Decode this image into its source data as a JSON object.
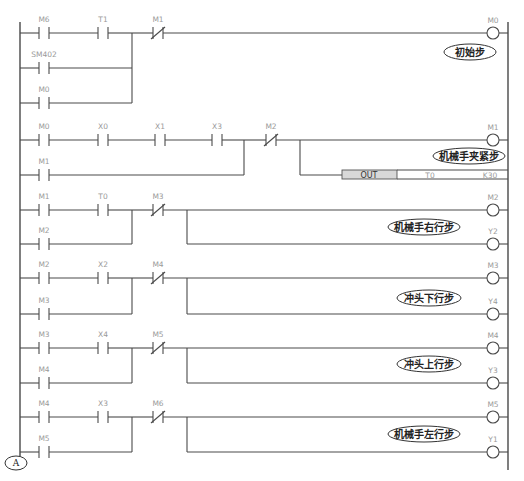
{
  "diagram": {
    "left_rail_x": 20,
    "right_rail_x": 508,
    "rail_top": 22,
    "rail_bottom": 470,
    "coil_x": 493,
    "colors": {
      "wire": "#4a4a4a",
      "label": "#9a9a9a",
      "note_text": "#222222",
      "out_box": "#d8d8d8"
    }
  },
  "rungs": [
    {
      "id": "rung-1",
      "main_y": 33,
      "series": [
        {
          "name": "M6",
          "type": "NO",
          "x": 44
        },
        {
          "name": "T1",
          "type": "NO",
          "x": 103
        }
      ],
      "parallel": [
        {
          "name": "SM402",
          "type": "NO",
          "x": 44,
          "y": 68
        },
        {
          "name": "M0",
          "type": "NO",
          "x": 44,
          "y": 103
        }
      ],
      "junction_x": 132,
      "interlock": {
        "name": "M1",
        "type": "NC",
        "x": 158
      },
      "outputs": [
        {
          "kind": "coil",
          "name": "M0",
          "y": 33
        }
      ],
      "note": {
        "text": "初始步",
        "cx": 470,
        "cy": 52,
        "rx": 26
      }
    },
    {
      "id": "rung-2",
      "main_y": 140,
      "series": [
        {
          "name": "M0",
          "type": "NO",
          "x": 44
        },
        {
          "name": "X0",
          "type": "NO",
          "x": 103
        },
        {
          "name": "X1",
          "type": "NO",
          "x": 160
        },
        {
          "name": "X3",
          "type": "NO",
          "x": 217
        }
      ],
      "parallel": [
        {
          "name": "M1",
          "type": "NO",
          "x": 44,
          "y": 175
        }
      ],
      "junction_x": 244,
      "interlock": {
        "name": "M2",
        "type": "NC",
        "x": 271
      },
      "branch_x": 300,
      "outputs": [
        {
          "kind": "coil",
          "name": "M1",
          "y": 140
        },
        {
          "kind": "instruction",
          "op": "OUT",
          "operand1": "T0",
          "operand2": "K30",
          "y": 175
        }
      ],
      "note": {
        "text": "机械手夹紧步",
        "cx": 469,
        "cy": 156,
        "rx": 36
      }
    },
    {
      "id": "rung-3",
      "main_y": 210,
      "series": [
        {
          "name": "M1",
          "type": "NO",
          "x": 44
        },
        {
          "name": "T0",
          "type": "NO",
          "x": 103
        }
      ],
      "parallel": [
        {
          "name": "M2",
          "type": "NO",
          "x": 44,
          "y": 244
        }
      ],
      "junction_x": 132,
      "interlock": {
        "name": "M3",
        "type": "NC",
        "x": 158
      },
      "branch_x": 187,
      "outputs": [
        {
          "kind": "coil",
          "name": "M2",
          "y": 210
        },
        {
          "kind": "coil",
          "name": "Y2",
          "y": 244
        }
      ],
      "note": {
        "text": "机械手右行步",
        "cx": 424,
        "cy": 227,
        "rx": 36
      }
    },
    {
      "id": "rung-4",
      "main_y": 278,
      "series": [
        {
          "name": "M2",
          "type": "NO",
          "x": 44
        },
        {
          "name": "X2",
          "type": "NO",
          "x": 103
        }
      ],
      "parallel": [
        {
          "name": "M3",
          "type": "NO",
          "x": 44,
          "y": 314
        }
      ],
      "junction_x": 132,
      "interlock": {
        "name": "M4",
        "type": "NC",
        "x": 158
      },
      "branch_x": 187,
      "outputs": [
        {
          "kind": "coil",
          "name": "M3",
          "y": 278
        },
        {
          "kind": "coil",
          "name": "Y4",
          "y": 314
        }
      ],
      "note": {
        "text": "冲头下行步",
        "cx": 429,
        "cy": 298,
        "rx": 32
      }
    },
    {
      "id": "rung-5",
      "main_y": 348,
      "series": [
        {
          "name": "M3",
          "type": "NO",
          "x": 44
        },
        {
          "name": "X4",
          "type": "NO",
          "x": 103
        }
      ],
      "parallel": [
        {
          "name": "M4",
          "type": "NO",
          "x": 44,
          "y": 383
        }
      ],
      "junction_x": 132,
      "interlock": {
        "name": "M5",
        "type": "NC",
        "x": 158
      },
      "branch_x": 187,
      "outputs": [
        {
          "kind": "coil",
          "name": "M4",
          "y": 348
        },
        {
          "kind": "coil",
          "name": "Y3",
          "y": 383
        }
      ],
      "note": {
        "text": "冲头上行步",
        "cx": 429,
        "cy": 364,
        "rx": 32
      }
    },
    {
      "id": "rung-6",
      "main_y": 417,
      "series": [
        {
          "name": "M4",
          "type": "NO",
          "x": 44
        },
        {
          "name": "X3",
          "type": "NO",
          "x": 103
        }
      ],
      "parallel": [
        {
          "name": "M5",
          "type": "NO",
          "x": 44,
          "y": 452
        }
      ],
      "junction_x": 132,
      "interlock": {
        "name": "M6",
        "type": "NC",
        "x": 158
      },
      "branch_x": 187,
      "outputs": [
        {
          "kind": "coil",
          "name": "M5",
          "y": 417
        },
        {
          "kind": "coil",
          "name": "Y1",
          "y": 452
        }
      ],
      "note": {
        "text": "机械手左行步",
        "cx": 424,
        "cy": 434,
        "rx": 36
      }
    }
  ],
  "connector": {
    "label": "A",
    "cx": 16,
    "cy": 463
  }
}
